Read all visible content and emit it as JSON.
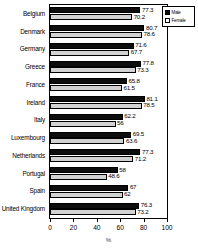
{
  "chart_data": {
    "type": "bar",
    "orientation": "horizontal",
    "title": "",
    "xlabel": "%",
    "ylabel": "",
    "xlim": [
      0,
      100
    ],
    "xticks": [
      0,
      20,
      40,
      60,
      80,
      100
    ],
    "grid": false,
    "legend_position": "top-right",
    "categories": [
      "Belgium",
      "Denmark",
      "Germany",
      "Greece",
      "France",
      "Ireland",
      "Italy",
      "Luxembourg",
      "Netherlands",
      "Portugal",
      "Spain",
      "United Kingdom"
    ],
    "series": [
      {
        "name": "Male",
        "color": "#0d0d0d",
        "values": [
          77.3,
          80.7,
          71.6,
          77.8,
          65.8,
          81.1,
          62.2,
          69.5,
          77.3,
          58,
          67,
          76.3
        ],
        "labels": [
          "77.3",
          "80.7",
          "71.6",
          "77.8",
          "65.8",
          "81.1",
          "62.2",
          "69.5",
          "77.3",
          "58",
          "67",
          "76.3"
        ]
      },
      {
        "name": "Female",
        "color": "#d2d2d2",
        "values": [
          70.2,
          78.6,
          67.7,
          73.3,
          61.5,
          78.5,
          56,
          63.6,
          71.2,
          48.6,
          62,
          73.2
        ],
        "labels": [
          "70.2",
          "78.6",
          "67.7",
          "73.3",
          "61.5",
          "78.5",
          "56",
          "63.6",
          "71.2",
          "48.6",
          "62",
          "73.2"
        ]
      }
    ]
  },
  "legend": {
    "items": [
      {
        "label": "Male"
      },
      {
        "label": "Female"
      }
    ]
  },
  "axis": {
    "x_tick_labels": [
      "0",
      "20",
      "40",
      "60",
      "80",
      "100"
    ],
    "x_axis_title": "%"
  }
}
